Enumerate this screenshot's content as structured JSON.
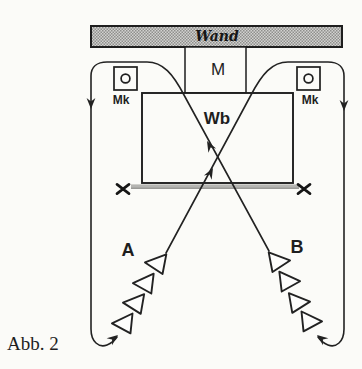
{
  "figure": {
    "caption": "Abb. 2",
    "labels": {
      "wall": "Wand",
      "m": "M",
      "mk_left": "Mk",
      "mk_right": "Mk",
      "wb": "Wb",
      "group_a": "A",
      "group_b": "B"
    },
    "colors": {
      "ink": "#222222",
      "paper": "#fbfbf8",
      "wall_fill_light": "#d2d2d0",
      "wall_fill_dark": "#8f8f8c",
      "ground_gray": "#b5b5b2"
    }
  }
}
